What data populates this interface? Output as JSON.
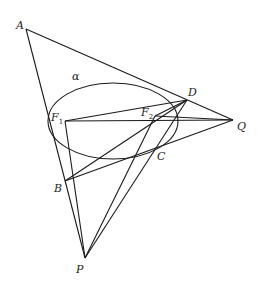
{
  "diagram": {
    "stroke_color": "#1a1a1a",
    "ellipse": {
      "name": "α",
      "cx": 113,
      "cy": 121,
      "rx": 65,
      "ry": 38
    },
    "points": {
      "A": {
        "label": "A",
        "x": 26,
        "y": 29
      },
      "D": {
        "label": "D",
        "x": 187,
        "y": 100
      },
      "Q": {
        "label": "Q",
        "x": 233,
        "y": 120
      },
      "F1": {
        "label": "F",
        "sub": "1",
        "x": 65,
        "y": 121
      },
      "F2": {
        "label": "F",
        "sub": "2",
        "x": 155,
        "y": 116
      },
      "B": {
        "label": "B",
        "x": 65,
        "y": 181
      },
      "C": {
        "label": "C",
        "x": 157,
        "y": 149
      },
      "P": {
        "label": "P",
        "x": 85,
        "y": 258
      }
    },
    "segments": [
      [
        "A",
        "Q"
      ],
      [
        "A",
        "P"
      ],
      [
        "F1",
        "D"
      ],
      [
        "F1",
        "Q"
      ],
      [
        "F1",
        "P"
      ],
      [
        "B",
        "D"
      ],
      [
        "B",
        "Q"
      ],
      [
        "P",
        "F2"
      ],
      [
        "P",
        "D"
      ],
      [
        "F2",
        "D"
      ],
      [
        "F2",
        "Q"
      ]
    ],
    "labels": {
      "A": "A",
      "D": "D",
      "Q": "Q",
      "F1": "F",
      "F1_sub": "1",
      "F2": "F",
      "F2_sub": "2",
      "B": "B",
      "C": "C",
      "P": "P",
      "alpha": "α"
    }
  }
}
